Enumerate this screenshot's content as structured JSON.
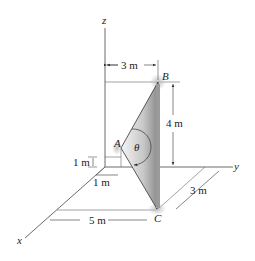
{
  "figure": {
    "axes": {
      "x": "x",
      "y": "y",
      "z": "z"
    },
    "points": {
      "A": "A",
      "B": "B",
      "C": "C"
    },
    "angle_label": "θ",
    "dimensions": {
      "top_width": "3 m",
      "height_B": "4 m",
      "height_A": "1 m",
      "offset_A": "1 m",
      "depth_C": "3 m",
      "x_C": "5 m"
    },
    "colors": {
      "line": "#333333",
      "plate_light": "#f2f2f2",
      "plate_dark": "#8c8c8c"
    }
  }
}
